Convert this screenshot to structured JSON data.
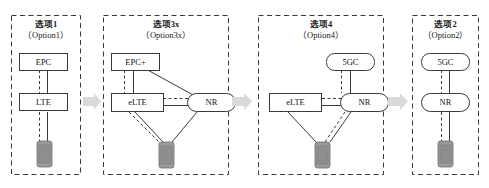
{
  "figure": {
    "background_color": "#ffffff",
    "panel_border_color": "#3a3a3a",
    "node_border_color": "#3a3a3a",
    "link_color": "#3a3a3a",
    "arrow_color": "#d6d6d6",
    "device_color": "#9a9a9a"
  },
  "panels": [
    {
      "id": "option1",
      "title_cn": "选项1",
      "title_en": "（Option1）",
      "nodes": [
        {
          "id": "epc",
          "label": "EPC",
          "shape": "rect"
        },
        {
          "id": "lte",
          "label": "LTE",
          "shape": "rect"
        },
        {
          "id": "device",
          "label": "UE",
          "shape": "device"
        }
      ],
      "links": [
        {
          "from": "epc",
          "to": "lte",
          "style": "dashed"
        },
        {
          "from": "epc",
          "to": "lte",
          "style": "solid"
        },
        {
          "from": "lte",
          "to": "device",
          "style": "dashed"
        },
        {
          "from": "lte",
          "to": "device",
          "style": "solid"
        }
      ]
    },
    {
      "id": "option3x",
      "title_cn": "选项3x",
      "title_en": "（Option3x）",
      "nodes": [
        {
          "id": "epcplus",
          "label": "EPC+",
          "shape": "rect"
        },
        {
          "id": "elte",
          "label": "eLTE",
          "shape": "rect"
        },
        {
          "id": "nr",
          "label": "NR",
          "shape": "rounded"
        },
        {
          "id": "device",
          "label": "UE",
          "shape": "device"
        }
      ],
      "links": [
        {
          "from": "epcplus",
          "to": "elte",
          "style": "dashed"
        },
        {
          "from": "epcplus",
          "to": "elte",
          "style": "solid"
        },
        {
          "from": "epcplus",
          "to": "nr",
          "style": "solid"
        },
        {
          "from": "elte",
          "to": "nr",
          "style": "dashed"
        },
        {
          "from": "elte",
          "to": "nr",
          "style": "solid"
        },
        {
          "from": "elte",
          "to": "device",
          "style": "dashed"
        },
        {
          "from": "elte",
          "to": "device",
          "style": "solid"
        },
        {
          "from": "nr",
          "to": "device",
          "style": "solid"
        }
      ]
    },
    {
      "id": "option4",
      "title_cn": "选项4",
      "title_en": "（Option4）",
      "nodes": [
        {
          "id": "fivegc",
          "label": "5GC",
          "shape": "rounded"
        },
        {
          "id": "elte",
          "label": "eLTE",
          "shape": "rect"
        },
        {
          "id": "nr",
          "label": "NR",
          "shape": "rounded"
        },
        {
          "id": "device",
          "label": "UE",
          "shape": "device"
        }
      ],
      "links": [
        {
          "from": "fivegc",
          "to": "nr",
          "style": "dashed"
        },
        {
          "from": "fivegc",
          "to": "nr",
          "style": "solid"
        },
        {
          "from": "elte",
          "to": "nr",
          "style": "dashed"
        },
        {
          "from": "elte",
          "to": "nr",
          "style": "solid"
        },
        {
          "from": "elte",
          "to": "device",
          "style": "solid"
        },
        {
          "from": "nr",
          "to": "device",
          "style": "dashed"
        },
        {
          "from": "nr",
          "to": "device",
          "style": "solid"
        }
      ]
    },
    {
      "id": "option2",
      "title_cn": "选项2",
      "title_en": "（Option2）",
      "nodes": [
        {
          "id": "fivegc",
          "label": "5GC",
          "shape": "rounded"
        },
        {
          "id": "nr",
          "label": "NR",
          "shape": "rounded"
        },
        {
          "id": "device",
          "label": "UE",
          "shape": "device"
        }
      ],
      "links": [
        {
          "from": "fivegc",
          "to": "nr",
          "style": "dashed"
        },
        {
          "from": "fivegc",
          "to": "nr",
          "style": "solid"
        },
        {
          "from": "nr",
          "to": "device",
          "style": "dashed"
        },
        {
          "from": "nr",
          "to": "device",
          "style": "solid"
        }
      ]
    }
  ],
  "arrows": [
    {
      "id": "arrow-1-2",
      "from_panel": "option1",
      "to_panel": "option3x"
    },
    {
      "id": "arrow-2-3",
      "from_panel": "option3x",
      "to_panel": "option4"
    },
    {
      "id": "arrow-3-4",
      "from_panel": "option4",
      "to_panel": "option2"
    }
  ]
}
